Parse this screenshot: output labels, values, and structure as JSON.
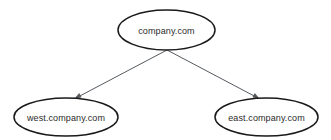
{
  "diagram": {
    "background_color": "#ffffff",
    "node_stroke_color": "#1a1a1a",
    "node_fill_color": "#ffffff",
    "edge_color": "#555a5f",
    "label_color": "#2b2b2b",
    "nodes": [
      {
        "id": "root",
        "label": "company.com",
        "shape": "ellipse",
        "cx": 166.5,
        "cy": 30,
        "rx": 48.5,
        "ry": 20
      },
      {
        "id": "west",
        "label": "west.company.com",
        "shape": "ellipse",
        "cx": 66,
        "cy": 117,
        "rx": 52,
        "ry": 19
      },
      {
        "id": "east",
        "label": "east.company.com",
        "shape": "ellipse",
        "cx": 266.5,
        "cy": 117,
        "rx": 51.5,
        "ry": 19
      }
    ],
    "edges": [
      {
        "id": "root-to-west",
        "from": "root",
        "to": "west",
        "from_label": "company.com",
        "to_label": "west.company.com",
        "x1": 167,
        "y1": 50,
        "x2": 74,
        "y2": 99,
        "arrowhead": "to"
      },
      {
        "id": "root-to-east",
        "from": "root",
        "to": "east",
        "from_label": "company.com",
        "to_label": "east.company.com",
        "x1": 167,
        "y1": 50,
        "x2": 260,
        "y2": 99,
        "arrowhead": "to"
      }
    ]
  }
}
